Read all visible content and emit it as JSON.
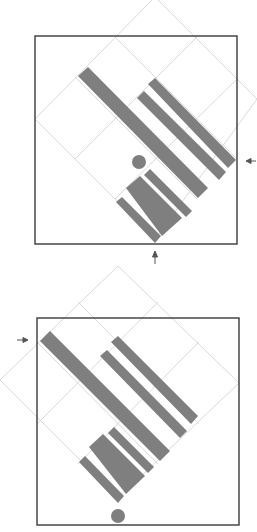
{
  "figure": {
    "colors": {
      "bar": "#7f7f7f",
      "grid": "#cfcfcf",
      "frame": "#3a3a3a",
      "background": "#ffffff"
    },
    "panels": [
      {
        "id": "top",
        "frame": {
          "x": 35,
          "y": 36,
          "w": 202,
          "h": 208
        },
        "arrows": [
          {
            "direction": "left",
            "x": 250,
            "y": 161
          },
          {
            "direction": "up",
            "x": 155,
            "y": 258
          }
        ],
        "dot": {
          "cx": 139,
          "cy": 162,
          "r": 7
        }
      },
      {
        "id": "bottom",
        "frame": {
          "x": 37,
          "y": 318,
          "w": 202,
          "h": 207
        },
        "arrows": [
          {
            "direction": "right",
            "x": 20,
            "y": 340
          }
        ],
        "dot": {
          "cx": 118,
          "cy": 516,
          "r": 7
        }
      }
    ]
  }
}
